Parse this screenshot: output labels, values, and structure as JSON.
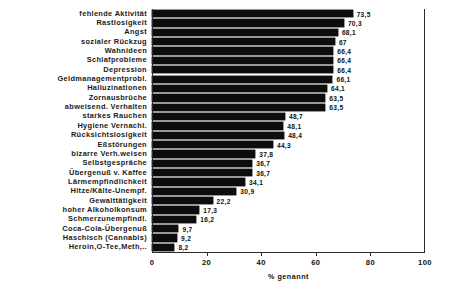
{
  "chart_data": {
    "type": "bar",
    "orientation": "horizontal",
    "title": "",
    "xlabel": "% genannt",
    "ylabel": "",
    "xlim": [
      0,
      100
    ],
    "xticks": [
      0,
      20,
      40,
      60,
      80,
      100
    ],
    "xticklabels": [
      "0",
      "20",
      "40",
      "60",
      "80",
      "100"
    ],
    "grid": false,
    "legend": null,
    "bar_color": "#0d0d0d",
    "categories": [
      "fehlende Aktivität",
      "Rastlosigkeit",
      "Angst",
      "sozialer Rückzug",
      "Wahnideen",
      "Schlafprobleme",
      "Depression",
      "Geldmanagementprobl.",
      "Halluzinationen",
      "Zornausbrüche",
      "abweisend. Verhalten",
      "starkes Rauchen",
      "Hygiene Vernachl.",
      "Rücksichtslosigkeit",
      "Eßstörungen",
      "bizarre Verh.weisen",
      "Selbstgespräche",
      "Übergenuß v. Kaffee",
      "Lärmempfindlichkeit",
      "Hitze/Kälte-Unempf.",
      "Gewalttätigkeit",
      "hoher Alkoholkonsum",
      "Schmerzunempfindl.",
      "Coca-Cola-Übergenuß",
      "Haschisch (Cannabis)",
      "Heroin,O-Tee,Meth,.."
    ],
    "values": [
      73.5,
      70.3,
      68.1,
      67,
      66.4,
      66.4,
      66.4,
      66.1,
      64.1,
      63.5,
      63.5,
      48.7,
      48.1,
      48.4,
      44.3,
      37.8,
      36.7,
      36.7,
      34.1,
      30.9,
      22.2,
      17.3,
      16.2,
      9.7,
      9.2,
      8.2
    ],
    "value_labels": [
      "73,5",
      "70,3",
      "68,1",
      "67",
      "66,4",
      "66,4",
      "66,4",
      "66,1",
      "64,1",
      "63,5",
      "63,5",
      "48,7",
      "48,1",
      "48,4",
      "44,3",
      "37,8",
      "36,7",
      "36,7",
      "34,1",
      "30,9",
      "22,2",
      "17,3",
      "16,2",
      "9,7",
      "9,2",
      "8,2"
    ]
  }
}
